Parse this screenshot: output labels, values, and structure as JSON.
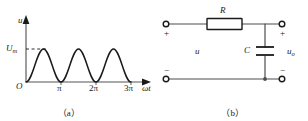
{
  "figure": {
    "panel_a": {
      "caption": "（a）",
      "axis": {
        "y_label": "u",
        "x_label": "ωt",
        "origin_label": "O",
        "amplitude_label": "U",
        "amplitude_subscript": "m",
        "x_ticks": [
          "π",
          "2π",
          "3π"
        ]
      },
      "waveform": {
        "name": "full-wave-rectified-sine",
        "description": "|sin(ωt)| rectified arches",
        "arch_count": 3,
        "amplitude": "Um",
        "dashed_level_line": true
      },
      "colors": {
        "axis": "#4d4d4d",
        "curve": "#1a1a1a"
      }
    },
    "panel_b": {
      "caption": "（b）",
      "title_note": "RC low-pass filter circuit",
      "components": [
        {
          "id": "resistor",
          "label": "R",
          "type": "resistor"
        },
        {
          "id": "capacitor",
          "label": "C",
          "type": "capacitor"
        }
      ],
      "labels": {
        "input_voltage": "u",
        "output_voltage": "u",
        "output_subscript": "o"
      },
      "polarity": {
        "input_top": "+",
        "input_bottom": "−",
        "output_top": "+",
        "output_bottom": "−"
      },
      "terminals": 4,
      "colors": {
        "wire": "#4d4d4d",
        "component": "#1a1a1a"
      }
    }
  }
}
